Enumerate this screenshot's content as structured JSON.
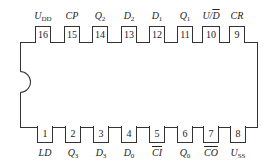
{
  "diagram": {
    "type": "ic-pinout",
    "package": "DIP-16",
    "top_pins": [
      {
        "number": "16",
        "label": "U",
        "sub": "DD",
        "overline": false
      },
      {
        "number": "15",
        "label": "CP",
        "sub": "",
        "overline": false
      },
      {
        "number": "14",
        "label": "Q",
        "sub": "2",
        "overline": false
      },
      {
        "number": "13",
        "label": "D",
        "sub": "2",
        "overline": false
      },
      {
        "number": "12",
        "label": "D",
        "sub": "1",
        "overline": false
      },
      {
        "number": "11",
        "label": "Q",
        "sub": "1",
        "overline": false
      },
      {
        "number": "10",
        "label": "U/D",
        "sub": "",
        "overline": "D"
      },
      {
        "number": "9",
        "label": "CR",
        "sub": "",
        "overline": false
      }
    ],
    "bottom_pins": [
      {
        "number": "1",
        "label": "LD",
        "sub": "",
        "overline": false
      },
      {
        "number": "2",
        "label": "Q",
        "sub": "3",
        "overline": false
      },
      {
        "number": "3",
        "label": "D",
        "sub": "3",
        "overline": false
      },
      {
        "number": "4",
        "label": "D",
        "sub": "0",
        "overline": false
      },
      {
        "number": "5",
        "label": "CI",
        "sub": "",
        "overline": true
      },
      {
        "number": "6",
        "label": "Q",
        "sub": "0",
        "overline": false
      },
      {
        "number": "7",
        "label": "CO",
        "sub": "",
        "overline": true
      },
      {
        "number": "8",
        "label": "U",
        "sub": "SS",
        "overline": false
      }
    ]
  }
}
